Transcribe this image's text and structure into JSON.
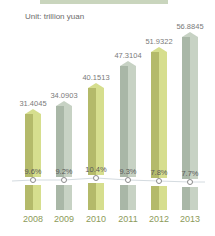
{
  "header": {
    "unit_label": "Unit: trillion yuan"
  },
  "colors": {
    "olive_left": "#b4ba6a",
    "olive_right": "#d6de8e",
    "gray_left": "#a9b7a7",
    "gray_right": "#c7d2c4",
    "year_text": "#8c9a5a"
  },
  "chart_data": {
    "type": "bar",
    "title": "",
    "unit": "Unit: trillion yuan",
    "categories": [
      "2008",
      "2009",
      "2010",
      "2011",
      "2012",
      "2013"
    ],
    "series": [
      {
        "name": "GDP (trillion yuan)",
        "values": [
          31.4045,
          34.0903,
          40.1513,
          47.3104,
          51.9322,
          56.8845
        ]
      },
      {
        "name": "Growth rate (%)",
        "values": [
          9.6,
          9.2,
          10.4,
          9.3,
          7.8,
          7.7
        ],
        "type": "line"
      }
    ],
    "value_labels": [
      "31.4045",
      "34.0903",
      "40.1513",
      "47.3104",
      "51.9322",
      "56.8845"
    ],
    "growth_labels": [
      "9.6%",
      "9.2%",
      "10.4%",
      "9.3%",
      "7.8%",
      "7.7%"
    ],
    "xlabel": "",
    "ylabel": "",
    "grid": false,
    "legend": "none"
  },
  "bars": [
    {
      "year": "2008",
      "value": "31.4045",
      "growth": "9.6%",
      "style": "olive"
    },
    {
      "year": "2009",
      "value": "34.0903",
      "growth": "9.2%",
      "style": "gray"
    },
    {
      "year": "2010",
      "value": "40.1513",
      "growth": "10.4%",
      "style": "olive"
    },
    {
      "year": "2011",
      "value": "47.3104",
      "growth": "9.3%",
      "style": "gray"
    },
    {
      "year": "2012",
      "value": "51.9322",
      "growth": "7.8%",
      "style": "olive"
    },
    {
      "year": "2013",
      "value": "56.8845",
      "growth": "7.7%",
      "style": "gray"
    }
  ]
}
